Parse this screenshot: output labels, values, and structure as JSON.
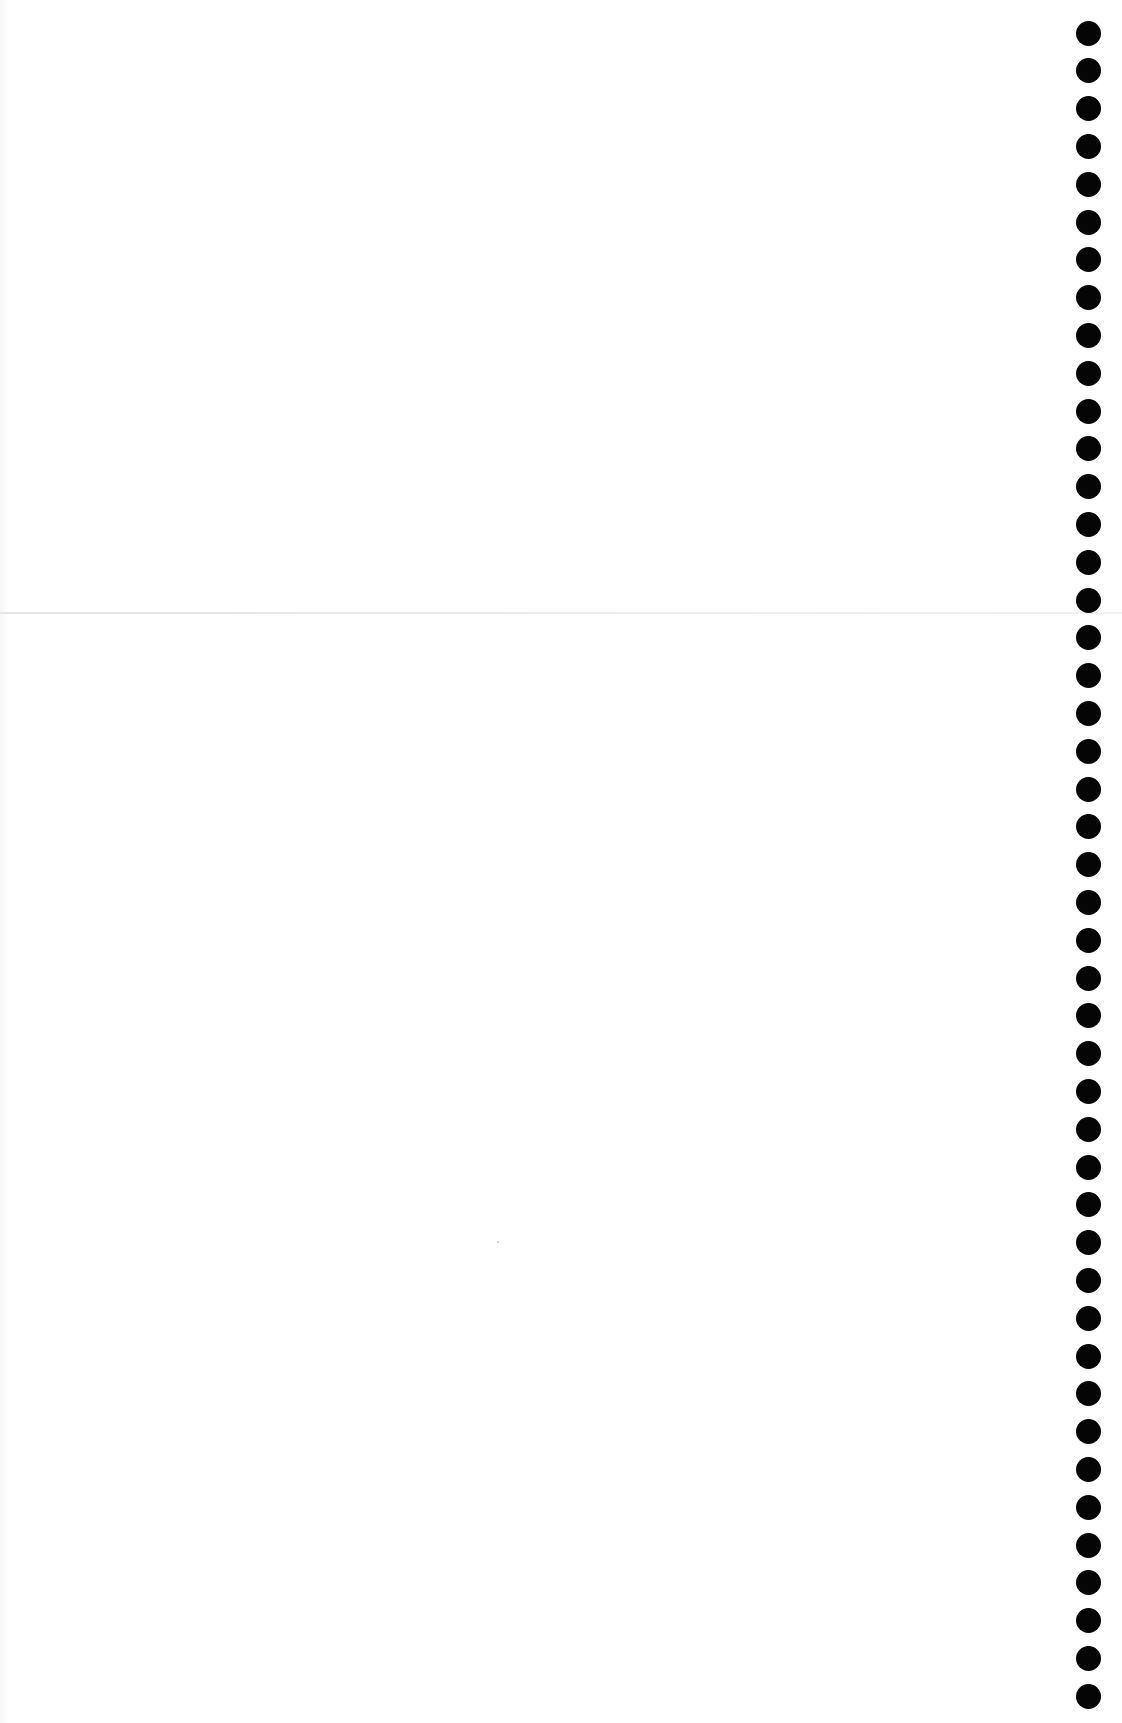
{
  "page": {
    "type": "blank ruled-free notebook sheet (scan)",
    "background_color": "#ffffff",
    "hole_color": "#050505",
    "fold_line_color": "#e6e6e6"
  },
  "top_bleed_text": "",
  "binding_holes": {
    "side": "right",
    "count": 45,
    "diameter_px": 25,
    "center_x_px": 1089,
    "first_center_y_px": 33,
    "pitch_px": 37.8
  }
}
